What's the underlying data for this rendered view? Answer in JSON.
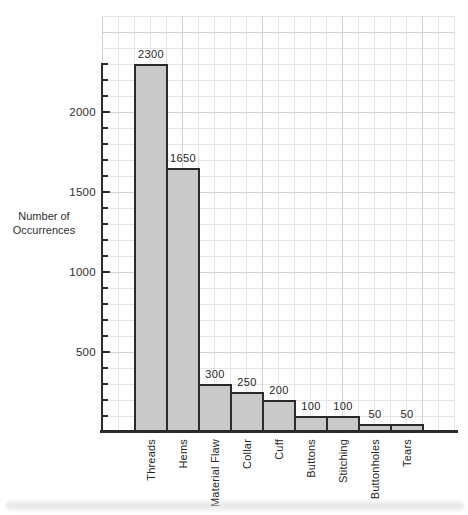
{
  "chart_data": {
    "type": "bar",
    "title": "",
    "categories": [
      "Threads",
      "Hems",
      "Material Flaw",
      "Collar",
      "Cuff",
      "Buttons",
      "Stitching",
      "Buttonholes",
      "Tears"
    ],
    "values": [
      2300,
      1650,
      300,
      250,
      200,
      100,
      100,
      50,
      50
    ],
    "bar_labels": [
      "2300",
      "1650",
      "300",
      "250",
      "200",
      "100",
      "100",
      "50",
      "50"
    ],
    "ylabel_lines": [
      "Number of",
      "Occurrences"
    ],
    "y_tick_labels": [
      "500",
      "1000",
      "1500",
      "2000"
    ],
    "y_tick_values": [
      500,
      1000,
      1500,
      2000
    ],
    "y_minor_step": 100,
    "ylim": [
      0,
      2300
    ],
    "xlabel": "",
    "grid": "on",
    "legend": "none",
    "colors": {
      "bar_fill": "#c9c9c9",
      "bar_border": "#2b2b2b",
      "axis": "#2b2b2b",
      "grid_minor": "#e4e4e7",
      "grid_major": "#d2d2d7",
      "text": "#2e2e2e"
    }
  }
}
